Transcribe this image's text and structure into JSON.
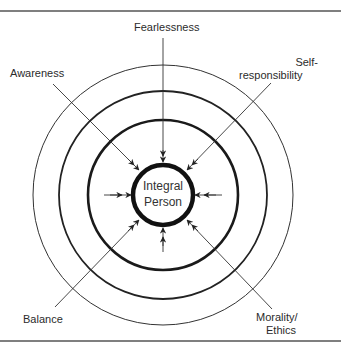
{
  "diagram": {
    "center_label_line1": "Integral",
    "center_label_line2": "Person",
    "labels": {
      "top": "Fearlessness",
      "top_left": "Awareness",
      "top_right_line1": "Self-",
      "top_right_line2": "responsibility",
      "bottom_left": "Balance",
      "bottom_right_line1": "Morality/",
      "bottom_right_line2": "Ethics"
    },
    "rings": [
      {
        "name": "outer",
        "radius": 130,
        "stroke": 1
      },
      {
        "name": "middle",
        "radius": 104,
        "stroke": 1.8
      },
      {
        "name": "inner",
        "radius": 75,
        "stroke": 2.6
      },
      {
        "name": "core",
        "radius": 30,
        "stroke": 4.5
      }
    ],
    "colors": {
      "line": "#222222",
      "text": "#2b2b2b",
      "divider": "#555555"
    }
  }
}
